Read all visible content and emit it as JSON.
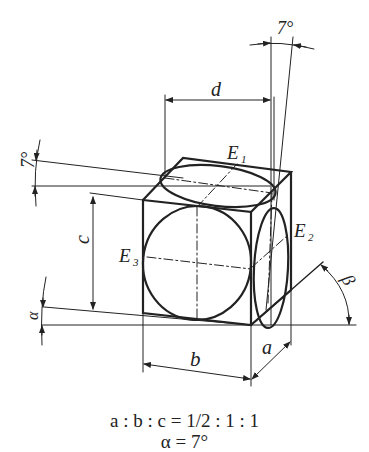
{
  "figure": {
    "colors": {
      "ink": "#222222",
      "background": "#ffffff"
    },
    "labels": {
      "d": "d",
      "c": "c",
      "b": "b",
      "a": "a",
      "E1": "E",
      "E1_sub": "1",
      "E2": "E",
      "E2_sub": "2",
      "E3": "E",
      "E3_sub": "3",
      "angle_top": "7°",
      "angle_left": "7°",
      "alpha": "α",
      "beta": "β"
    },
    "formula": {
      "ratio_line": "a : b : c = 1/2 : 1 : 1",
      "alpha_line": "α = 7°"
    }
  }
}
